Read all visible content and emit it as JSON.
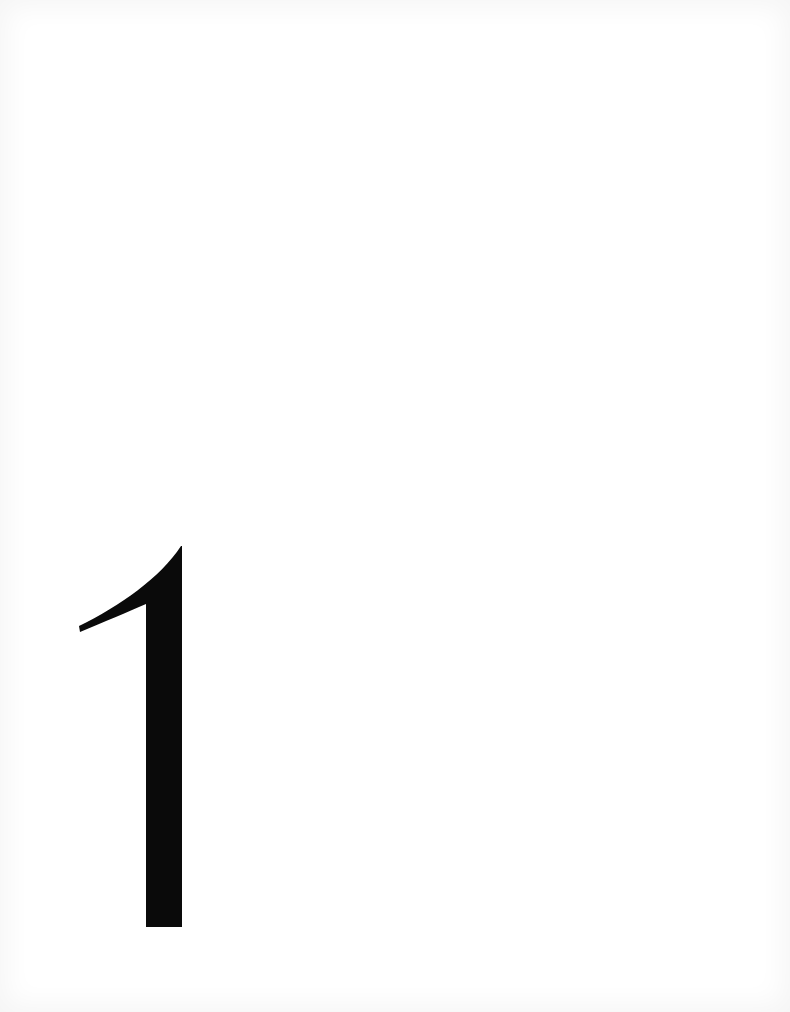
{
  "page": {
    "background_color": "#ffffff",
    "edge_shade_color": "#eeeeee"
  },
  "chapter_numeral": {
    "text": "1",
    "color": "#0a0a0a"
  }
}
